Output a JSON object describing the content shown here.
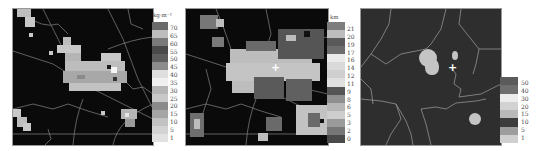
{
  "panels": [
    {
      "id": "vil",
      "unit": "kg·m⁻²",
      "legend_labels": [
        "70",
        "65",
        "60",
        "55",
        "50",
        "45",
        "40",
        "35",
        "30",
        "25",
        "20",
        "15",
        "10",
        "5",
        "1"
      ],
      "legend_colors": [
        "#6a6a6a",
        "#bdbdbd",
        "#7a7a7a",
        "#4a4a4a",
        "#5e5e5e",
        "#8c8c8c",
        "#dedede",
        "#f0f0f0",
        "#b5b5b5",
        "#c8c8c8",
        "#8a8a8a",
        "#a5a5a5",
        "#c2c2c2",
        "#d3d3d3",
        "#e2e2e2"
      ]
    },
    {
      "id": "echo-top",
      "unit": "km",
      "legend_labels": [
        "21",
        "20",
        "19",
        "17",
        "16",
        "14",
        "12",
        "11",
        "9",
        "8",
        "6",
        "5",
        "3",
        "2",
        "0"
      ],
      "legend_colors": [
        "#7d7d7d",
        "#bcbcbc",
        "#5a5a5a",
        "#6c6c6c",
        "#eaeaea",
        "#d9d9d9",
        "#cfcfcf",
        "#e0e0e0",
        "#555555",
        "#8f8f8f",
        "#b6b6b6",
        "#cdcdcd",
        "#9a9a9a",
        "#777777",
        "#4a4a4a"
      ]
    },
    {
      "id": "third-field",
      "unit": "",
      "legend_labels": [
        "50",
        "40",
        "30",
        "20",
        "15",
        "10",
        "5",
        "1"
      ],
      "legend_colors": [
        "#5b5b5b",
        "#6e6e6e",
        "#ececec",
        "#d2d2d2",
        "#b9b9b9",
        "#3c3c3c",
        "#9d9d9d",
        "#cfcfcf"
      ]
    }
  ],
  "chart_data": [
    {
      "type": "heatmap",
      "title": "",
      "colorbar_label": "kg·m⁻²",
      "colorbar_ticks": [
        70,
        65,
        60,
        55,
        50,
        45,
        40,
        35,
        30,
        25,
        20,
        15,
        10,
        5,
        1
      ],
      "grid": false
    },
    {
      "type": "heatmap",
      "title": "",
      "colorbar_label": "km",
      "colorbar_ticks": [
        21,
        20,
        19,
        17,
        16,
        14,
        12,
        11,
        9,
        8,
        6,
        5,
        3,
        2,
        0
      ],
      "grid": false
    },
    {
      "type": "heatmap",
      "title": "",
      "colorbar_label": "",
      "colorbar_ticks": [
        50,
        40,
        30,
        20,
        15,
        10,
        5,
        1
      ],
      "grid": false
    }
  ]
}
